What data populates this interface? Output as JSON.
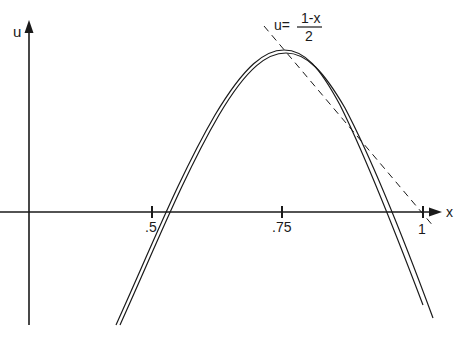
{
  "diagram": {
    "axes": {
      "x_label": "x",
      "y_label": "u",
      "x_ticks": [
        {
          "value": 0.5,
          "label": ".5"
        },
        {
          "value": 0.75,
          "label": ".75"
        },
        {
          "value": 1,
          "label": "1"
        }
      ]
    },
    "annotation": {
      "lhs": "u=",
      "numerator": "1-x",
      "denominator": "2"
    },
    "curves": [
      {
        "name": "solution-curve-1",
        "style": "solid"
      },
      {
        "name": "solution-curve-2",
        "style": "solid"
      },
      {
        "name": "line-u-equals-1-minus-x-over-2",
        "style": "dashed"
      }
    ],
    "colors": {
      "ink": "#1a1a1a",
      "background": "#ffffff"
    }
  }
}
